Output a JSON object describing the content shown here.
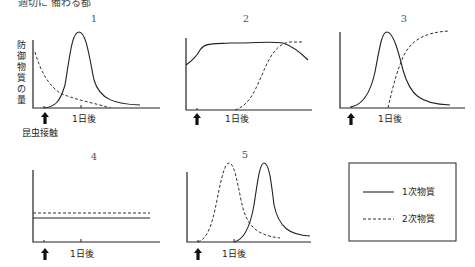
{
  "top_text": "適切に 備わる都",
  "yaxis_label": "防御物質の量",
  "contact_label": "昆虫接触",
  "tick_label": "1日後",
  "panels": [
    {
      "number": "1"
    },
    {
      "number": "2"
    },
    {
      "number": "3"
    },
    {
      "number": "4"
    },
    {
      "number": "5"
    }
  ],
  "legend": {
    "primary": "1次物質",
    "secondary": "2次物質"
  }
}
